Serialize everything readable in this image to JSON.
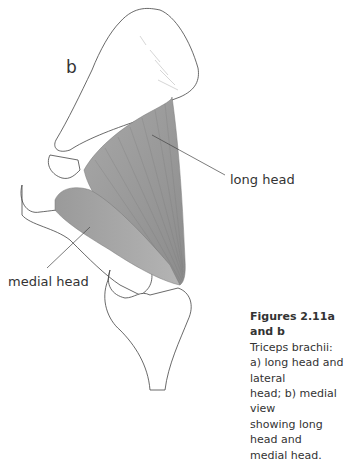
{
  "figure": {
    "panel_letter": "b",
    "labels": {
      "long_head": "long head",
      "medial_head": "medial head"
    }
  },
  "caption": {
    "title": "Figures 2.11a and b",
    "lines": [
      "Triceps brachii:",
      "a) long head and lateral",
      "head; b) medial view",
      "showing long head and",
      "medial head."
    ]
  }
}
